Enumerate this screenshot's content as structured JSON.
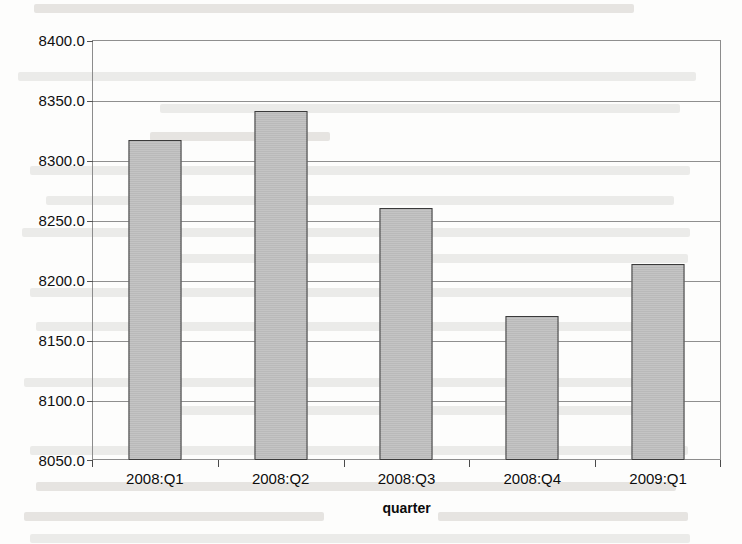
{
  "chart_data": {
    "type": "bar",
    "title": "",
    "subtitle": "",
    "xlabel": "quarter",
    "ylabel": "",
    "categories": [
      "2008:Q1",
      "2008:Q2",
      "2008:Q3",
      "2008:Q4",
      "2009:Q1"
    ],
    "values": [
      8317.0,
      8341.0,
      8260.0,
      8170.0,
      8213.0
    ],
    "ylim": [
      8050.0,
      8400.0
    ],
    "ytick_values": [
      8400.0,
      8350.0,
      8300.0,
      8250.0,
      8200.0,
      8150.0,
      8100.0,
      8050.0
    ],
    "ytick_labels": [
      "8400.0",
      "8350.0",
      "8300.0",
      "8250.0",
      "8200.0",
      "8150.0",
      "8100.0",
      "8050.0"
    ],
    "grid": true,
    "legend": false,
    "legend_position": "none",
    "bar_color": "#bcbcbc",
    "bar_border_color": "#3a3a3a",
    "axis_color": "#8c8c8c",
    "grid_color": "#8f8f8f",
    "background_color": "#fdfdfc",
    "annotations": []
  },
  "page": {
    "media": "scanned-page",
    "ghost_text_color": "#e9e8e6"
  }
}
